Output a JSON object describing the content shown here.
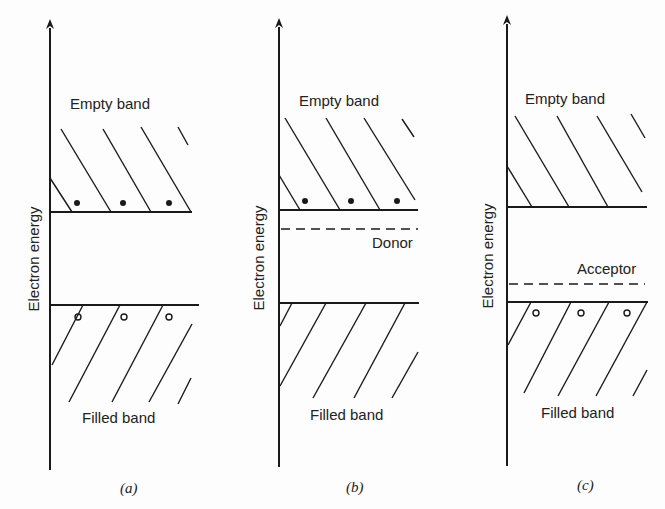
{
  "figure": {
    "axis_label": "Electron energy",
    "panels": [
      {
        "id": "a",
        "caption": "(a)",
        "upper_band_label": "Empty band",
        "lower_band_label": "Filled band",
        "impurity_level_label": null,
        "electrons_in_empty_band": 3,
        "holes_in_filled_band": 3
      },
      {
        "id": "b",
        "caption": "(b)",
        "upper_band_label": "Empty band",
        "lower_band_label": "Filled band",
        "impurity_level_label": "Donor",
        "electrons_in_empty_band": 3,
        "holes_in_filled_band": 0
      },
      {
        "id": "c",
        "caption": "(c)",
        "upper_band_label": "Empty band",
        "lower_band_label": "Filled band",
        "impurity_level_label": "Acceptor",
        "electrons_in_empty_band": 0,
        "holes_in_filled_band": 3
      }
    ],
    "colors": {
      "ink": "#1a1a1a",
      "background": "#fdfdfd"
    }
  }
}
